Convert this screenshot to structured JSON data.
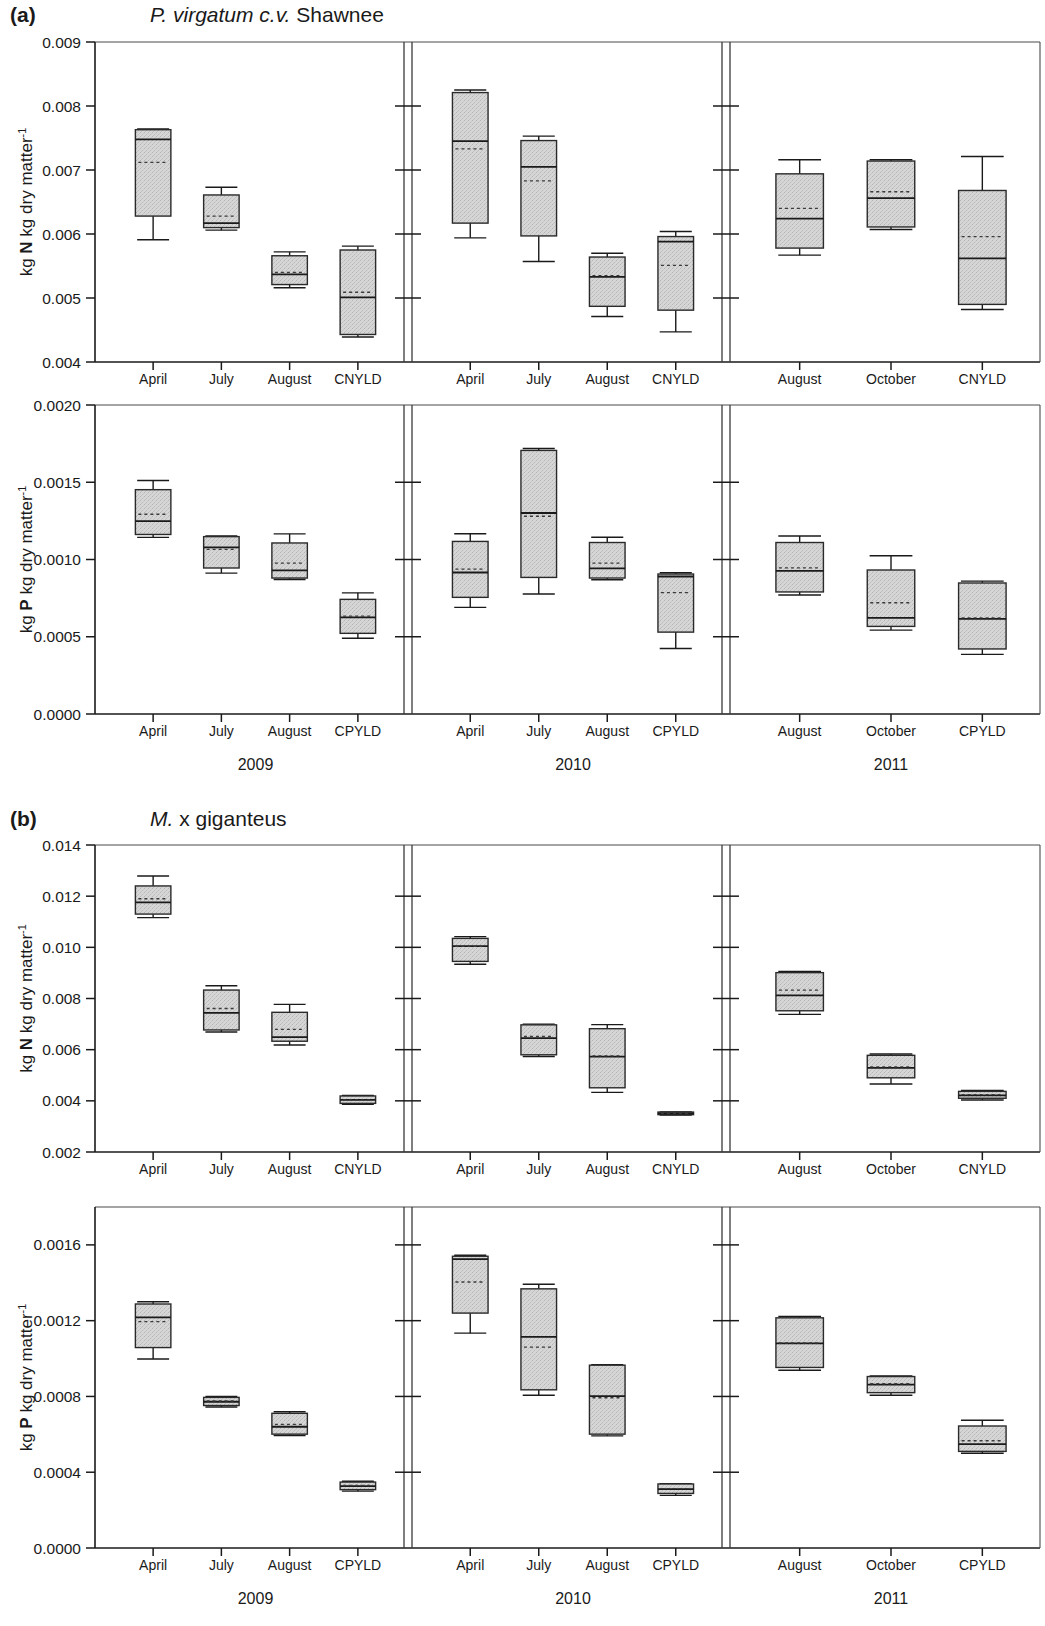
{
  "figure": {
    "panels": [
      {
        "letter": "(a)",
        "species_italic": "P. virgatum c.v.",
        "species_roman": " Shawnee"
      },
      {
        "letter": "(b)",
        "species_italic": "M.",
        "species_roman": " x giganteus"
      }
    ],
    "years": [
      "2009",
      "2010",
      "2011"
    ],
    "axis_titles": {
      "nitrogen": {
        "pre": "kg ",
        "bold": "N",
        "post": " kg dry matter",
        "sup": "-1"
      },
      "phosphorus": {
        "pre": "kg ",
        "bold": "P",
        "post": " kg dry matter",
        "sup": "-1"
      }
    }
  },
  "chart_data": [
    {
      "type": "box",
      "id": "a-nitrogen",
      "title": "P. virgatum c.v. Shawnee",
      "ylabel": "kg N kg dry matter-1",
      "xlabel": "",
      "ylim": [
        0.004,
        0.009
      ],
      "yticks": [
        0.004,
        0.005,
        0.006,
        0.007,
        0.008,
        0.009
      ],
      "ytick_labels": [
        "0.004",
        "0.005",
        "0.006",
        "0.007",
        "0.008",
        "0.009"
      ],
      "grid": false,
      "legend": "none",
      "groups": [
        {
          "year": "2009",
          "categories": [
            "April",
            "July",
            "August",
            "CNYLD"
          ],
          "boxes": [
            {
              "category": "April",
              "whisker_low": 0.00591,
              "q1": 0.00628,
              "median": 0.00748,
              "mean": 0.00712,
              "q3": 0.00763,
              "whisker_high": 0.00764
            },
            {
              "category": "July",
              "whisker_low": 0.00606,
              "q1": 0.0061,
              "median": 0.00617,
              "mean": 0.00628,
              "q3": 0.00661,
              "whisker_high": 0.00673
            },
            {
              "category": "August",
              "whisker_low": 0.00516,
              "q1": 0.00521,
              "median": 0.00537,
              "mean": 0.0054,
              "q3": 0.00566,
              "whisker_high": 0.00572
            },
            {
              "category": "CNYLD",
              "whisker_low": 0.00439,
              "q1": 0.00443,
              "median": 0.00501,
              "mean": 0.00509,
              "q3": 0.00575,
              "whisker_high": 0.00581
            }
          ]
        },
        {
          "year": "2010",
          "categories": [
            "April",
            "July",
            "August",
            "CNYLD"
          ],
          "boxes": [
            {
              "category": "April",
              "whisker_low": 0.00594,
              "q1": 0.00617,
              "median": 0.00745,
              "mean": 0.00733,
              "q3": 0.00821,
              "whisker_high": 0.00825
            },
            {
              "category": "July",
              "whisker_low": 0.00557,
              "q1": 0.00597,
              "median": 0.00705,
              "mean": 0.00683,
              "q3": 0.00746,
              "whisker_high": 0.00753
            },
            {
              "category": "August",
              "whisker_low": 0.00471,
              "q1": 0.00487,
              "median": 0.00533,
              "mean": 0.00535,
              "q3": 0.00564,
              "whisker_high": 0.0057
            },
            {
              "category": "CNYLD",
              "whisker_low": 0.00447,
              "q1": 0.00481,
              "median": 0.00588,
              "mean": 0.00551,
              "q3": 0.00596,
              "whisker_high": 0.00604
            }
          ]
        },
        {
          "year": "2011",
          "categories": [
            "August",
            "October",
            "CNYLD"
          ],
          "boxes": [
            {
              "category": "August",
              "whisker_low": 0.00567,
              "q1": 0.00578,
              "median": 0.00624,
              "mean": 0.0064,
              "q3": 0.00694,
              "whisker_high": 0.00716
            },
            {
              "category": "October",
              "whisker_low": 0.00607,
              "q1": 0.00611,
              "median": 0.00656,
              "mean": 0.00666,
              "q3": 0.00714,
              "whisker_high": 0.00716
            },
            {
              "category": "CNYLD",
              "whisker_low": 0.00482,
              "q1": 0.0049,
              "median": 0.00562,
              "mean": 0.00596,
              "q3": 0.00668,
              "whisker_high": 0.00721
            }
          ]
        }
      ]
    },
    {
      "type": "box",
      "id": "a-phosphorus",
      "title": "",
      "ylabel": "kg P kg dry matter-1",
      "xlabel": "",
      "ylim": [
        0.0,
        0.002
      ],
      "yticks": [
        0.0,
        0.0005,
        0.001,
        0.0015,
        0.002
      ],
      "ytick_labels": [
        "0.0000",
        "0.0005",
        "0.0010",
        "0.0015",
        "0.0020"
      ],
      "grid": false,
      "legend": "none",
      "groups": [
        {
          "year": "2009",
          "categories": [
            "April",
            "July",
            "August",
            "CPYLD"
          ],
          "boxes": [
            {
              "category": "April",
              "whisker_low": 0.001143,
              "q1": 0.001162,
              "median": 0.001249,
              "mean": 0.001293,
              "q3": 0.001452,
              "whisker_high": 0.001511
            },
            {
              "category": "July",
              "whisker_low": 0.000912,
              "q1": 0.000945,
              "median": 0.001078,
              "mean": 0.001065,
              "q3": 0.001148,
              "whisker_high": 0.001152
            },
            {
              "category": "August",
              "whisker_low": 0.000871,
              "q1": 0.00088,
              "median": 0.00093,
              "mean": 0.000977,
              "q3": 0.001107,
              "whisker_high": 0.001166
            },
            {
              "category": "CPYLD",
              "whisker_low": 0.00049,
              "q1": 0.000522,
              "median": 0.000625,
              "mean": 0.000633,
              "q3": 0.000742,
              "whisker_high": 0.000784
            }
          ]
        },
        {
          "year": "2010",
          "categories": [
            "April",
            "July",
            "August",
            "CPYLD"
          ],
          "boxes": [
            {
              "category": "April",
              "whisker_low": 0.00069,
              "q1": 0.000755,
              "median": 0.000916,
              "mean": 0.000938,
              "q3": 0.001117,
              "whisker_high": 0.001167
            },
            {
              "category": "July",
              "whisker_low": 0.000777,
              "q1": 0.000884,
              "median": 0.001301,
              "mean": 0.00128,
              "q3": 0.001706,
              "whisker_high": 0.001718
            },
            {
              "category": "August",
              "whisker_low": 0.000869,
              "q1": 0.00088,
              "median": 0.000942,
              "mean": 0.000976,
              "q3": 0.00111,
              "whisker_high": 0.001144
            },
            {
              "category": "CPYLD",
              "whisker_low": 0.000424,
              "q1": 0.00053,
              "median": 0.00089,
              "mean": 0.000785,
              "q3": 0.000906,
              "whisker_high": 0.000914
            }
          ]
        },
        {
          "year": "2011",
          "categories": [
            "August",
            "October",
            "CPYLD"
          ],
          "boxes": [
            {
              "category": "August",
              "whisker_low": 0.00077,
              "q1": 0.00079,
              "median": 0.000926,
              "mean": 0.000946,
              "q3": 0.00111,
              "whisker_high": 0.001152
            },
            {
              "category": "October",
              "whisker_low": 0.000543,
              "q1": 0.000567,
              "median": 0.000622,
              "mean": 0.00072,
              "q3": 0.000932,
              "whisker_high": 0.001024
            },
            {
              "category": "CPYLD",
              "whisker_low": 0.000386,
              "q1": 0.000421,
              "median": 0.000616,
              "mean": 0.000622,
              "q3": 0.000848,
              "whisker_high": 0.00086
            }
          ]
        }
      ]
    },
    {
      "type": "box",
      "id": "b-nitrogen",
      "title": "M. x giganteus",
      "ylabel": "kg N kg dry matter-1",
      "xlabel": "",
      "ylim": [
        0.002,
        0.014
      ],
      "yticks": [
        0.002,
        0.004,
        0.006,
        0.008,
        0.01,
        0.012,
        0.014
      ],
      "ytick_labels": [
        "0.002",
        "0.004",
        "0.006",
        "0.008",
        "0.010",
        "0.012",
        "0.014"
      ],
      "grid": false,
      "legend": "none",
      "groups": [
        {
          "year": "2009",
          "categories": [
            "April",
            "July",
            "August",
            "CNYLD"
          ],
          "boxes": [
            {
              "category": "April",
              "whisker_low": 0.01116,
              "q1": 0.0113,
              "median": 0.01176,
              "mean": 0.0119,
              "q3": 0.0124,
              "whisker_high": 0.01279
            },
            {
              "category": "July",
              "whisker_low": 0.00669,
              "q1": 0.00677,
              "median": 0.00744,
              "mean": 0.00761,
              "q3": 0.00833,
              "whisker_high": 0.0085
            },
            {
              "category": "August",
              "whisker_low": 0.00618,
              "q1": 0.00633,
              "median": 0.00649,
              "mean": 0.00679,
              "q3": 0.00746,
              "whisker_high": 0.00777
            },
            {
              "category": "CNYLD",
              "whisker_low": 0.00386,
              "q1": 0.0039,
              "median": 0.00404,
              "mean": 0.00404,
              "q3": 0.00419,
              "whisker_high": 0.00421
            }
          ]
        },
        {
          "year": "2010",
          "categories": [
            "April",
            "July",
            "August",
            "CNYLD"
          ],
          "boxes": [
            {
              "category": "April",
              "whisker_low": 0.00934,
              "q1": 0.00945,
              "median": 0.01005,
              "mean": 0.01004,
              "q3": 0.01035,
              "whisker_high": 0.01042
            },
            {
              "category": "July",
              "whisker_low": 0.00573,
              "q1": 0.0058,
              "median": 0.00645,
              "mean": 0.00652,
              "q3": 0.00697,
              "whisker_high": 0.007
            },
            {
              "category": "August",
              "whisker_low": 0.00433,
              "q1": 0.00451,
              "median": 0.00573,
              "mean": 0.00576,
              "q3": 0.00682,
              "whisker_high": 0.00698
            },
            {
              "category": "CNYLD",
              "whisker_low": 0.00344,
              "q1": 0.00346,
              "median": 0.00351,
              "mean": 0.00351,
              "q3": 0.00356,
              "whisker_high": 0.00357
            }
          ]
        },
        {
          "year": "2011",
          "categories": [
            "August",
            "October",
            "CNYLD"
          ],
          "boxes": [
            {
              "category": "August",
              "whisker_low": 0.00738,
              "q1": 0.00752,
              "median": 0.00812,
              "mean": 0.00833,
              "q3": 0.00901,
              "whisker_high": 0.00906
            },
            {
              "category": "October",
              "whisker_low": 0.00466,
              "q1": 0.0049,
              "median": 0.00529,
              "mean": 0.00533,
              "q3": 0.00578,
              "whisker_high": 0.00583
            },
            {
              "category": "CNYLD",
              "whisker_low": 0.00403,
              "q1": 0.0041,
              "median": 0.00421,
              "mean": 0.00424,
              "q3": 0.00437,
              "whisker_high": 0.00441
            }
          ]
        }
      ]
    },
    {
      "type": "box",
      "id": "b-phosphorus",
      "title": "",
      "ylabel": "kg P kg dry matter-1",
      "xlabel": "",
      "ylim": [
        0.0,
        0.0018
      ],
      "yticks": [
        0.0,
        0.0004,
        0.0008,
        0.0012,
        0.0016
      ],
      "ytick_labels": [
        "0.0000",
        "0.0004",
        "0.0008",
        "0.0012",
        "0.0016"
      ],
      "grid": false,
      "legend": "none",
      "groups": [
        {
          "year": "2009",
          "categories": [
            "April",
            "July",
            "August",
            "CPYLD"
          ],
          "boxes": [
            {
              "category": "April",
              "whisker_low": 0.000998,
              "q1": 0.001058,
              "median": 0.001217,
              "mean": 0.001195,
              "q3": 0.001288,
              "whisker_high": 0.0013
            },
            {
              "category": "July",
              "whisker_low": 0.000744,
              "q1": 0.000752,
              "median": 0.000772,
              "mean": 0.000776,
              "q3": 0.000795,
              "whisker_high": 0.0008
            },
            {
              "category": "August",
              "whisker_low": 0.000594,
              "q1": 0.000601,
              "median": 0.00064,
              "mean": 0.000653,
              "q3": 0.000711,
              "whisker_high": 0.000719
            },
            {
              "category": "CPYLD",
              "whisker_low": 0.0003,
              "q1": 0.000308,
              "median": 0.000327,
              "mean": 0.00033,
              "q3": 0.000348,
              "whisker_high": 0.000352
            }
          ]
        },
        {
          "year": "2010",
          "categories": [
            "April",
            "July",
            "August",
            "CPYLD"
          ],
          "boxes": [
            {
              "category": "April",
              "whisker_low": 0.001134,
              "q1": 0.00124,
              "median": 0.001525,
              "mean": 0.001404,
              "q3": 0.00154,
              "whisker_high": 0.001545
            },
            {
              "category": "July",
              "whisker_low": 0.000806,
              "q1": 0.000835,
              "median": 0.001114,
              "mean": 0.00106,
              "q3": 0.001368,
              "whisker_high": 0.001392
            },
            {
              "category": "August",
              "whisker_low": 0.000592,
              "q1": 0.000601,
              "median": 0.000802,
              "mean": 0.000793,
              "q3": 0.000965,
              "whisker_high": 0.000968
            },
            {
              "category": "CPYLD",
              "whisker_low": 0.000278,
              "q1": 0.000288,
              "median": 0.000311,
              "mean": 0.000313,
              "q3": 0.000338,
              "whisker_high": 0.00034
            }
          ]
        },
        {
          "year": "2011",
          "categories": [
            "August",
            "October",
            "CPYLD"
          ],
          "boxes": [
            {
              "category": "August",
              "whisker_low": 0.000938,
              "q1": 0.000953,
              "median": 0.00108,
              "mean": 0.001082,
              "q3": 0.001215,
              "whisker_high": 0.001222
            },
            {
              "category": "October",
              "whisker_low": 0.000806,
              "q1": 0.00082,
              "median": 0.000862,
              "mean": 0.000867,
              "q3": 0.000905,
              "whisker_high": 0.000908
            },
            {
              "category": "CPYLD",
              "whisker_low": 0.0005,
              "q1": 0.00051,
              "median": 0.000548,
              "mean": 0.000566,
              "q3": 0.000644,
              "whisker_high": 0.000674
            }
          ]
        }
      ]
    }
  ],
  "colors": {
    "box_fill": "#d2d2d2",
    "line": "#1a1a1a",
    "frame": "#4a4a4a",
    "background": "#ffffff"
  }
}
